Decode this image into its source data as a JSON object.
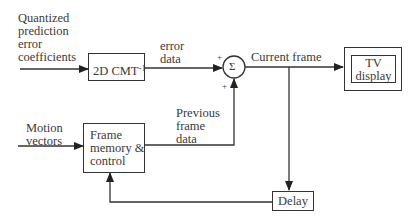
{
  "diagram": {
    "type": "block-diagram",
    "title": "",
    "inputs": {
      "coefficients": [
        "Quantized",
        "prediction",
        "error",
        "coefficients"
      ],
      "motion_vectors": [
        "Motion",
        "vectors"
      ]
    },
    "blocks": {
      "inverse_transform": {
        "label": "2D CMT",
        "superscript": "-1"
      },
      "summer": {
        "symbol": "Σ",
        "plus_top": "+",
        "plus_bottom": "+"
      },
      "tv_display": {
        "line1": "TV",
        "line2": "display"
      },
      "frame_memory": {
        "line1": "Frame",
        "line2": "memory &",
        "line3": "control"
      },
      "delay": {
        "label": "Delay"
      }
    },
    "edge_labels": {
      "error_data": [
        "error",
        "data"
      ],
      "current_frame": "Current frame",
      "previous_frame_data": [
        "Previous",
        "frame",
        "data"
      ]
    },
    "edges": [
      {
        "from": "Quantized prediction error coefficients",
        "to": "2D CMT^-1"
      },
      {
        "from": "2D CMT^-1",
        "to": "Σ",
        "label": "error data"
      },
      {
        "from": "Σ",
        "to": "TV display",
        "label": "Current frame"
      },
      {
        "from": "Σ",
        "to": "Delay"
      },
      {
        "from": "Delay",
        "to": "Frame memory & control"
      },
      {
        "from": "Motion vectors",
        "to": "Frame memory & control"
      },
      {
        "from": "Frame memory & control",
        "to": "Σ",
        "label": "Previous frame data"
      }
    ],
    "colors": {
      "line": "#333333",
      "text": "#3a3a3a",
      "background": "#ffffff"
    }
  }
}
